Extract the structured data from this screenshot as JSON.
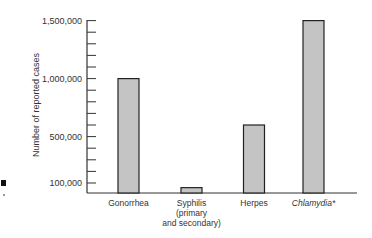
{
  "chart_data": {
    "type": "bar",
    "title": "",
    "xlabel": "",
    "ylabel": "Number of reported cases",
    "categories": [
      "Gonorrhea",
      "Syphilis (primary and secondary)",
      "Herpes",
      "Chlamydia*"
    ],
    "category_labels": [
      [
        "Gonorrhea"
      ],
      [
        "Syphilis",
        "(primary",
        "and secondary)"
      ],
      [
        "Herpes"
      ],
      [
        "Chlamydia*"
      ]
    ],
    "italic_categories": [
      "Chlamydia*"
    ],
    "values": [
      1000000,
      60000,
      600000,
      1500000
    ],
    "yticks": [
      100000,
      500000,
      1000000,
      1500000
    ],
    "ytick_labels": [
      "100,000",
      "500,000",
      "1,000,000",
      "1,500,000"
    ],
    "minor_tick_step": 100000,
    "ylim": [
      0,
      1500000
    ],
    "grid": false,
    "legend": null,
    "bar_color": "#c4c4c4",
    "bar_edge_color": "#222222"
  }
}
